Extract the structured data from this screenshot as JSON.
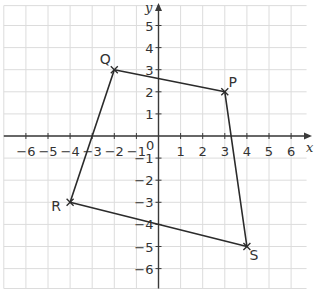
{
  "diagram": {
    "type": "coordinate-grid",
    "axes": {
      "x_label": "x",
      "y_label": "y",
      "x_range": [
        -6,
        6
      ],
      "y_range": [
        -6,
        5
      ],
      "origin_label": "0",
      "x_ticks": [
        "-6",
        "-5",
        "-4",
        "-3",
        "-2",
        "-1",
        "1",
        "2",
        "3",
        "4",
        "5",
        "6"
      ],
      "y_ticks": [
        "5",
        "4",
        "3",
        "2",
        "1",
        "-1",
        "-2",
        "-3",
        "-4",
        "-5",
        "-6"
      ]
    },
    "points": [
      {
        "label": "Q",
        "x": -2,
        "y": 3
      },
      {
        "label": "P",
        "x": 3,
        "y": 2
      },
      {
        "label": "S",
        "x": 4,
        "y": -5
      },
      {
        "label": "R",
        "x": -4,
        "y": -3
      }
    ],
    "polygon_order": [
      "Q",
      "P",
      "S",
      "R"
    ],
    "colors": {
      "grid": "#dcdcdc",
      "axis": "#3a3a3a",
      "shape": "#2b2b2b"
    }
  }
}
